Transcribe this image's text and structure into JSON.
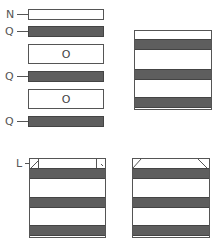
{
  "diagram": {
    "type": "component-assembly",
    "colors": {
      "outline": "#555555",
      "dark_fill": "#5e5e5e",
      "light_fill": "#ffffff",
      "label": "#555555"
    },
    "exploded_stack": {
      "parts": [
        {
          "label": "N",
          "kind": "thin-white-bar"
        },
        {
          "label": "Q",
          "kind": "dark-bar"
        },
        {
          "label": "O",
          "kind": "white-box",
          "inner_label": "O"
        },
        {
          "label": "Q",
          "kind": "dark-bar"
        },
        {
          "label": "O",
          "kind": "white-box",
          "inner_label": "O"
        },
        {
          "label": "Q",
          "kind": "dark-bar"
        }
      ]
    },
    "assembled_top_right": {
      "description": "Assembled stack: white, dark, white, dark, white, dark"
    },
    "assembled_bottom_left": {
      "label": "L",
      "description": "Assembly with square corner pieces on top row"
    },
    "assembled_bottom_right": {
      "description": "Assembly with beveled (chamfered) top corners"
    }
  },
  "labels": {
    "n": "N",
    "q1": "Q",
    "o1": "O",
    "q2": "Q",
    "o2": "O",
    "q3": "Q",
    "l": "L"
  }
}
